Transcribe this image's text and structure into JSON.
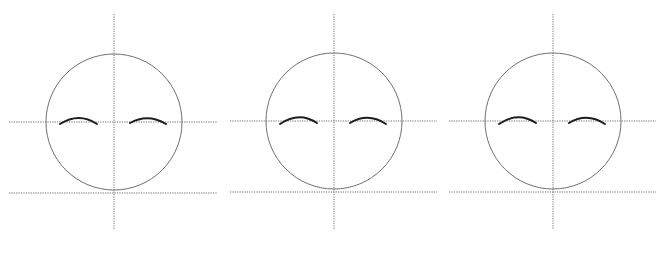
{
  "diagram": {
    "title": "",
    "width": 669,
    "height": 253,
    "colors": {
      "background": "#ffffff",
      "guide_line": "#6e6e6e",
      "head_outline": "#707070",
      "eyebrow": "#1e1e1e"
    },
    "panels": [
      {
        "id": "face-1",
        "center_x": 114,
        "center_y": 122,
        "radius": 68,
        "vertical_guide": {
          "x": 114,
          "y1": 14,
          "y2": 229
        },
        "eye_line": {
          "y": 122,
          "x1": 9,
          "x2": 217
        },
        "chin_line": {
          "y": 193,
          "x1": 9,
          "x2": 217
        },
        "eyebrows": [
          {
            "side": "left",
            "path": "M60 124 Q79 112 97 124"
          },
          {
            "side": "right",
            "path": "M130 123 Q148 113 166 124"
          }
        ]
      },
      {
        "id": "face-2",
        "center_x": 334,
        "center_y": 121,
        "radius": 68,
        "vertical_guide": {
          "x": 334,
          "y1": 14,
          "y2": 229
        },
        "eye_line": {
          "y": 121,
          "x1": 230,
          "x2": 437
        },
        "chin_line": {
          "y": 192,
          "x1": 230,
          "x2": 437
        },
        "eyebrows": [
          {
            "side": "left",
            "path": "M280 124 Q299 111 317 123"
          },
          {
            "side": "right",
            "path": "M350 123 Q368 112 386 124"
          }
        ]
      },
      {
        "id": "face-3",
        "center_x": 553,
        "center_y": 121,
        "radius": 68,
        "vertical_guide": {
          "x": 553,
          "y1": 14,
          "y2": 229
        },
        "eye_line": {
          "y": 121,
          "x1": 449,
          "x2": 656
        },
        "chin_line": {
          "y": 192,
          "x1": 449,
          "x2": 656
        },
        "eyebrows": [
          {
            "side": "left",
            "path": "M499 124 Q518 111 536 123"
          },
          {
            "side": "right",
            "path": "M569 123 Q587 112 605 124"
          }
        ]
      }
    ]
  }
}
